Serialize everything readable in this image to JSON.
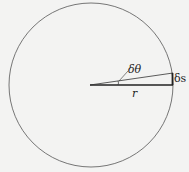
{
  "diagram": {
    "labels": {
      "angle": "δθ",
      "arc": "δs",
      "radius": "r"
    },
    "colors": {
      "background": "#f3f3f2",
      "stroke": "#333333"
    }
  }
}
